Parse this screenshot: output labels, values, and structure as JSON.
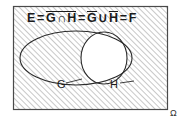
{
  "figure": {
    "kind": "venn-diagram",
    "universe_label": "Ω",
    "formula": {
      "lhs": "E",
      "eq1": "=",
      "term_complement_intersection": {
        "overlined": true,
        "left": "G",
        "operator": "∩",
        "right": "H"
      },
      "eq2": "=",
      "term_union_of_complements": {
        "left": "G",
        "left_overlined": true,
        "operator": "∪",
        "right": "H",
        "right_overlined": true
      },
      "eq3": "=",
      "rhs": "F",
      "plain_text": "E = ¬(G ∩ H) = Ḡ ∪ H̄ = F"
    },
    "sets": [
      {
        "id": "G",
        "label": "G",
        "shape": "ellipse",
        "position": "left"
      },
      {
        "id": "H",
        "label": "H",
        "shape": "ellipse",
        "position": "right"
      }
    ],
    "shading": {
      "pattern": "diagonal-hatch",
      "direction": "lower-left-to-upper-right",
      "shaded_region": "complement of G ∩ H",
      "unshaded_region": "G ∩ H",
      "hatch_color": "#9a9a9a",
      "background_color": "#ffffff",
      "stroke_color": "#2a2a2a"
    }
  }
}
